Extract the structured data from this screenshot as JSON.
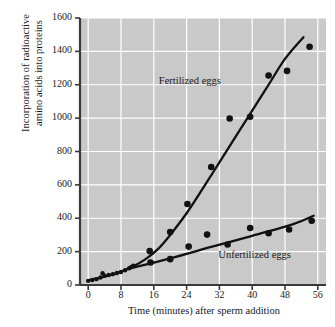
{
  "chart_data": {
    "type": "scatter",
    "title": "",
    "xlabel": "Time (minutes) after sperm addition",
    "ylabel_line1": "Incorporation of radioactive",
    "ylabel_line2": "amino acids into proteins",
    "xlim": [
      -2,
      58
    ],
    "ylim": [
      0,
      1600
    ],
    "xticks": [
      0,
      8,
      16,
      24,
      32,
      40,
      48,
      56
    ],
    "yticks": [
      0,
      200,
      400,
      600,
      800,
      1000,
      1200,
      1400,
      1600
    ],
    "grid": true,
    "legend_position": "inline-annotation",
    "plot_background": "#c9c9c9",
    "gridline_color": "#ffffff",
    "marker_color": "#111111",
    "line_color": "#111111",
    "series": [
      {
        "name": "Fertilized eggs",
        "annotation": "Fertilized eggs",
        "annotation_x": 26,
        "annotation_y": 1215,
        "points": [
          [
            0,
            25
          ],
          [
            1,
            30
          ],
          [
            2,
            35
          ],
          [
            3,
            45
          ],
          [
            3.5,
            70
          ],
          [
            4,
            55
          ],
          [
            5,
            60
          ],
          [
            6,
            65
          ],
          [
            7,
            72
          ],
          [
            8,
            78
          ],
          [
            9,
            88
          ],
          [
            10,
            100
          ],
          [
            10.5,
            108
          ],
          [
            11,
            115
          ],
          [
            15,
            203
          ],
          [
            15.2,
            135
          ],
          [
            20,
            318
          ],
          [
            24.2,
            485
          ],
          [
            30,
            707
          ],
          [
            34.5,
            998
          ],
          [
            39.5,
            1008
          ],
          [
            44,
            1255
          ],
          [
            48.5,
            1283
          ],
          [
            54,
            1428
          ]
        ],
        "fit_line": [
          [
            0,
            28
          ],
          [
            4,
            50
          ],
          [
            8,
            80
          ],
          [
            11,
            112
          ],
          [
            14,
            155
          ],
          [
            17,
            215
          ],
          [
            20,
            300
          ],
          [
            24,
            430
          ],
          [
            28,
            580
          ],
          [
            32,
            735
          ],
          [
            36,
            890
          ],
          [
            40,
            1045
          ],
          [
            44,
            1200
          ],
          [
            48,
            1355
          ],
          [
            52.5,
            1485
          ]
        ]
      },
      {
        "name": "Unfertilized eggs",
        "annotation": "Unfertilized eggs",
        "annotation_x": 41,
        "annotation_y": 175,
        "points": [
          [
            20,
            155
          ],
          [
            24.5,
            230
          ],
          [
            29,
            302
          ],
          [
            34,
            243
          ],
          [
            39.5,
            342
          ],
          [
            44,
            310
          ],
          [
            49,
            333
          ],
          [
            54.5,
            385
          ]
        ],
        "fit_line": [
          [
            10,
            98
          ],
          [
            20,
            160
          ],
          [
            30,
            228
          ],
          [
            40,
            295
          ],
          [
            50,
            365
          ],
          [
            55,
            415
          ]
        ]
      }
    ]
  },
  "axes": {
    "ytick_labels": [
      "1600",
      "1400",
      "1200",
      "1000",
      "800",
      "600",
      "400",
      "200",
      "0"
    ],
    "xtick_labels": [
      "0",
      "8",
      "16",
      "24",
      "32",
      "40",
      "48",
      "56"
    ]
  }
}
